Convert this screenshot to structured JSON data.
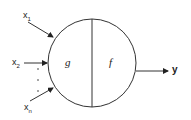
{
  "diagram": {
    "inputs": [
      {
        "base": "x",
        "sub": "1"
      },
      {
        "base": "x",
        "sub": "2"
      },
      {
        "base": "x",
        "sub": "n"
      }
    ],
    "ellipsis": "⋮",
    "node_left_label": "g",
    "node_right_label": "f",
    "output_label": "y",
    "colors": {
      "stroke": "#333333",
      "text": "#222222"
    }
  }
}
